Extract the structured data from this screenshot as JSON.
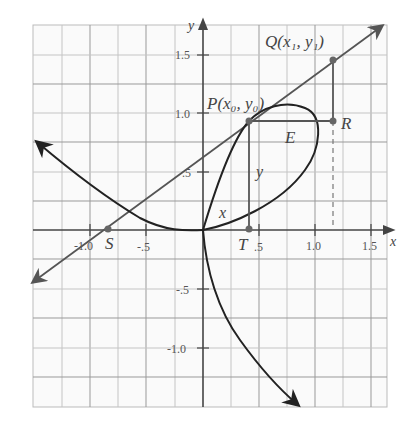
{
  "figure": {
    "axes": {
      "x_label": "x",
      "y_label": "y",
      "x_ticks": [
        "-1.0",
        "-.5",
        ".5",
        "1.0",
        "1.5"
      ],
      "y_ticks": [
        "1.5",
        "1.0",
        ".5",
        "-.5",
        "-1.0"
      ],
      "x_range": [
        -1.25,
        1.6
      ],
      "y_range": [
        -1.3,
        1.75
      ],
      "grid_step": 0.25
    },
    "points": {
      "P": "P(x₀, y₀)",
      "Q": "Q(x₁, y₁)",
      "R": "R",
      "S": "S",
      "T": "T"
    },
    "labels": {
      "E": "E",
      "x": "x",
      "y": "y"
    },
    "colors": {
      "curve": "#222222",
      "tangent": "#555555",
      "grid_minor": "#bbbbbb",
      "grid_major": "#888888",
      "axis": "#444444",
      "point": "#666666"
    }
  }
}
